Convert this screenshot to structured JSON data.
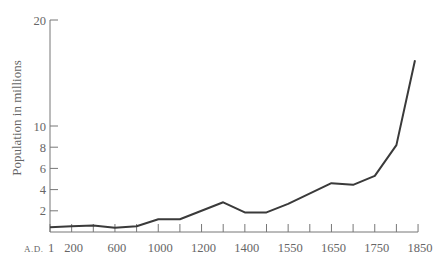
{
  "chart_data": {
    "type": "line",
    "title": "",
    "xlabel": "",
    "ylabel": "Population in millions",
    "x_prefix": "A.D.",
    "x_axis_note": "non-uniform time scale: evenly spaced ticks",
    "x_ticks": [
      "1",
      "200",
      "400",
      "600",
      "800",
      "1000",
      "1100",
      "1200",
      "1300",
      "1400",
      "1500",
      "1550",
      "1600",
      "1650",
      "1700",
      "1750",
      "1800",
      "1850"
    ],
    "x_tick_labels": [
      "1",
      "200",
      "",
      "600",
      "",
      "1000",
      "",
      "1200",
      "",
      "1400",
      "",
      "1550",
      "",
      "1650",
      "",
      "1750",
      "",
      "1850"
    ],
    "y_ticks": [
      2,
      4,
      6,
      8,
      10,
      20
    ],
    "ylim": [
      0,
      20
    ],
    "grid": false,
    "legend": null,
    "series": [
      {
        "name": "Population",
        "x": [
          "1",
          "200",
          "400",
          "600",
          "800",
          "1000",
          "1100",
          "1300",
          "1400",
          "1500",
          "1550",
          "1650",
          "1700",
          "1750",
          "1800",
          "1850"
        ],
        "values": [
          0.45,
          0.55,
          0.6,
          0.4,
          0.55,
          1.2,
          1.2,
          2.8,
          1.85,
          1.85,
          2.65,
          4.6,
          4.45,
          5.3,
          8.2,
          16.2
        ]
      }
    ]
  }
}
